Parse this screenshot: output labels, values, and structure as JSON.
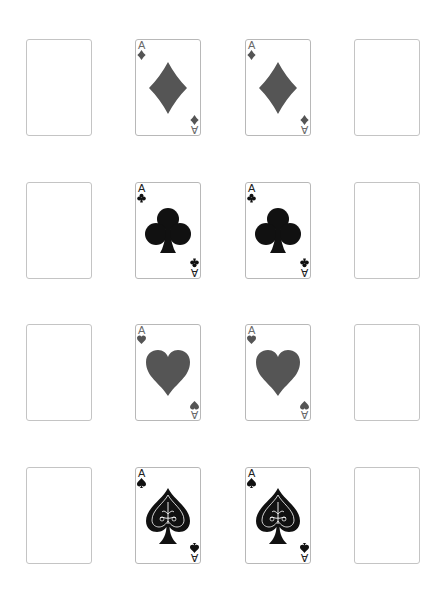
{
  "board": {
    "layout": {
      "columns": 4,
      "rows": 4
    },
    "colors": {
      "red_suit": "#555555",
      "black_suit": "#111111",
      "card_border": "#b8b8b8",
      "background": "#ffffff"
    },
    "rows": [
      {
        "cards": [
          {
            "state": "empty"
          },
          {
            "state": "face-up",
            "rank": "A",
            "suit": "diamonds"
          },
          {
            "state": "face-up",
            "rank": "A",
            "suit": "diamonds"
          },
          {
            "state": "empty"
          }
        ]
      },
      {
        "cards": [
          {
            "state": "empty"
          },
          {
            "state": "face-up",
            "rank": "A",
            "suit": "clubs"
          },
          {
            "state": "face-up",
            "rank": "A",
            "suit": "clubs"
          },
          {
            "state": "empty"
          }
        ]
      },
      {
        "cards": [
          {
            "state": "empty"
          },
          {
            "state": "face-up",
            "rank": "A",
            "suit": "hearts"
          },
          {
            "state": "face-up",
            "rank": "A",
            "suit": "hearts"
          },
          {
            "state": "empty"
          }
        ]
      },
      {
        "cards": [
          {
            "state": "empty"
          },
          {
            "state": "face-up",
            "rank": "A",
            "suit": "spades"
          },
          {
            "state": "face-up",
            "rank": "A",
            "suit": "spades"
          },
          {
            "state": "empty"
          }
        ]
      }
    ]
  }
}
